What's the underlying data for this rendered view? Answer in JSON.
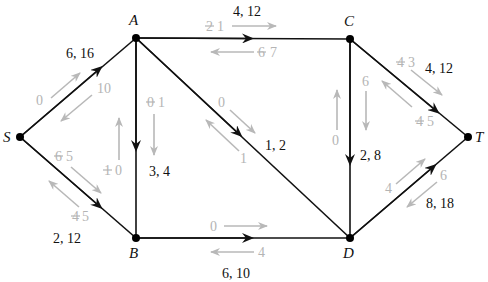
{
  "nodes": {
    "S": {
      "label": "S",
      "x": 20,
      "y": 137
    },
    "A": {
      "label": "A",
      "x": 136,
      "y": 38
    },
    "B": {
      "label": "B",
      "x": 136,
      "y": 238
    },
    "C": {
      "label": "C",
      "x": 350,
      "y": 39
    },
    "D": {
      "label": "D",
      "x": 350,
      "y": 238
    },
    "T": {
      "label": "T",
      "x": 468,
      "y": 137
    }
  },
  "edges": [
    {
      "from": "S",
      "to": "A",
      "label": "6, 16",
      "forward_residual": "0",
      "backward_residual": "10"
    },
    {
      "from": "S",
      "to": "B",
      "label": "2, 12",
      "forward_residual_old": "6",
      "forward_residual": "5",
      "backward_residual_old": "4",
      "backward_residual": "5"
    },
    {
      "from": "A",
      "to": "C",
      "label": "4, 12",
      "forward_residual_old": "2",
      "forward_residual": "1",
      "backward_residual_old": "6",
      "backward_residual": "7"
    },
    {
      "from": "A",
      "to": "B",
      "label": "3, 4",
      "forward_residual_old": "0",
      "forward_residual": "1",
      "backward_residual_old": "1",
      "backward_residual": "0"
    },
    {
      "from": "A",
      "to": "D",
      "label": "1, 2",
      "forward_residual": "0",
      "backward_residual": "1"
    },
    {
      "from": "C",
      "to": "D",
      "label": "2, 8",
      "forward_residual": "6",
      "backward_residual": "0"
    },
    {
      "from": "C",
      "to": "T",
      "label": "4, 12",
      "forward_residual_old": "4",
      "forward_residual": "3",
      "backward_residual_old": "4",
      "backward_residual": "5"
    },
    {
      "from": "B",
      "to": "D",
      "label": "6, 10",
      "forward_residual": "0",
      "backward_residual": "4"
    },
    {
      "from": "D",
      "to": "T",
      "label": "8, 18",
      "forward_residual": "4",
      "backward_residual": "6"
    }
  ]
}
